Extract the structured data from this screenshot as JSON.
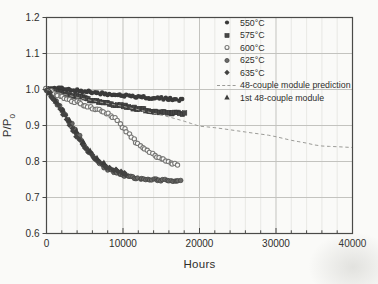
{
  "figure_label": "module-power-degradation-plot",
  "chart_data": {
    "type": "scatter",
    "title": "",
    "xlabel": "Hours",
    "ylabel": "P/P0",
    "ylabel_main": "P/P",
    "ylabel_sub": "0",
    "xlim": [
      0,
      40000
    ],
    "ylim": [
      0.6,
      1.2
    ],
    "x_major_ticks": [
      0,
      10000,
      20000,
      30000,
      40000
    ],
    "x_major_tick_labels": [
      "0",
      "10000",
      "20000",
      "30000",
      "40000"
    ],
    "x_minor_step": 2000,
    "y_major_ticks": [
      0.6,
      0.7,
      0.8,
      0.9,
      1.0,
      1.1,
      1.2
    ],
    "y_major_tick_labels": [
      "0.6",
      "0.7",
      "0.8",
      "0.9",
      "1.0",
      "1.1",
      "1.2"
    ],
    "grid": {
      "on": true,
      "major_color": "#c3c3bf",
      "minor_color": "#e4e4e0"
    },
    "axis_color": "#4a4a48",
    "text_color": "#2e2e2c",
    "legend_position": "top-right-inside",
    "series": [
      {
        "name": "550°C",
        "marker": "circle-filled",
        "color": "#3a3a3a",
        "style": "scatter-dense",
        "step": 250,
        "points": [
          [
            0,
            1.0
          ],
          [
            1000,
            1.001
          ],
          [
            2000,
            1.005
          ],
          [
            3000,
            1.0
          ],
          [
            4000,
            0.997
          ],
          [
            5000,
            0.995
          ],
          [
            6000,
            0.992
          ],
          [
            7000,
            0.99
          ],
          [
            8000,
            0.988
          ],
          [
            9000,
            0.985
          ],
          [
            10000,
            0.983
          ],
          [
            11000,
            0.982
          ],
          [
            12000,
            0.98
          ],
          [
            13000,
            0.978
          ],
          [
            14000,
            0.977
          ],
          [
            15000,
            0.975
          ],
          [
            16000,
            0.974
          ],
          [
            17000,
            0.972
          ],
          [
            17800,
            0.971
          ]
        ]
      },
      {
        "name": "575°C",
        "marker": "square-filled",
        "color": "#474746",
        "style": "scatter-dense",
        "step": 250,
        "points": [
          [
            0,
            1.0
          ],
          [
            1000,
            0.995
          ],
          [
            2000,
            0.99
          ],
          [
            3000,
            0.985
          ],
          [
            4000,
            0.98
          ],
          [
            5000,
            0.975
          ],
          [
            6000,
            0.97
          ],
          [
            7000,
            0.965
          ],
          [
            8000,
            0.962
          ],
          [
            9000,
            0.958
          ],
          [
            10000,
            0.955
          ],
          [
            11000,
            0.95
          ],
          [
            12000,
            0.947
          ],
          [
            13000,
            0.943
          ],
          [
            14000,
            0.94
          ],
          [
            15000,
            0.938
          ],
          [
            16000,
            0.936
          ],
          [
            17000,
            0.934
          ],
          [
            18200,
            0.932
          ]
        ]
      },
      {
        "name": "600°C",
        "marker": "circle-open",
        "color": "#787876",
        "style": "scatter-dense",
        "step": 300,
        "points": [
          [
            0,
            1.0
          ],
          [
            500,
            0.995
          ],
          [
            1500,
            0.985
          ],
          [
            2500,
            0.975
          ],
          [
            3500,
            0.968
          ],
          [
            4500,
            0.96
          ],
          [
            5500,
            0.952
          ],
          [
            6500,
            0.945
          ],
          [
            7500,
            0.938
          ],
          [
            8500,
            0.928
          ],
          [
            9000,
            0.92
          ],
          [
            9500,
            0.908
          ],
          [
            10000,
            0.895
          ],
          [
            10500,
            0.882
          ],
          [
            11000,
            0.87
          ],
          [
            11500,
            0.858
          ],
          [
            12000,
            0.848
          ],
          [
            12500,
            0.84
          ],
          [
            13000,
            0.833
          ],
          [
            13500,
            0.826
          ],
          [
            14000,
            0.82
          ],
          [
            14500,
            0.814
          ],
          [
            15000,
            0.809
          ],
          [
            15500,
            0.804
          ],
          [
            16000,
            0.8
          ],
          [
            16500,
            0.795
          ],
          [
            17000,
            0.79
          ],
          [
            17300,
            0.788
          ]
        ]
      },
      {
        "name": "625°C",
        "marker": "circle-gray",
        "color": "#6a6a68",
        "style": "scatter-dense",
        "step": 250,
        "points": [
          [
            0,
            1.0
          ],
          [
            500,
            0.99
          ],
          [
            1000,
            0.975
          ],
          [
            1500,
            0.96
          ],
          [
            2000,
            0.945
          ],
          [
            2500,
            0.928
          ],
          [
            3000,
            0.912
          ],
          [
            3500,
            0.895
          ],
          [
            4000,
            0.878
          ],
          [
            4500,
            0.86
          ],
          [
            5000,
            0.843
          ],
          [
            5500,
            0.828
          ],
          [
            6000,
            0.815
          ],
          [
            6500,
            0.803
          ],
          [
            7000,
            0.793
          ],
          [
            7500,
            0.785
          ],
          [
            8000,
            0.779
          ],
          [
            8500,
            0.774
          ],
          [
            9000,
            0.77
          ],
          [
            9500,
            0.766
          ],
          [
            10000,
            0.762
          ],
          [
            11000,
            0.757
          ],
          [
            12000,
            0.753
          ],
          [
            13000,
            0.751
          ],
          [
            14000,
            0.75
          ],
          [
            15000,
            0.749
          ],
          [
            16000,
            0.748
          ],
          [
            17000,
            0.747
          ],
          [
            17500,
            0.745
          ]
        ]
      },
      {
        "name": "635°C",
        "marker": "diamond-filled",
        "color": "#434342",
        "style": "scatter-dense",
        "step": 220,
        "points": [
          [
            0,
            1.0
          ],
          [
            400,
            0.99
          ],
          [
            800,
            0.978
          ],
          [
            1200,
            0.965
          ],
          [
            1600,
            0.952
          ],
          [
            2000,
            0.94
          ],
          [
            2400,
            0.926
          ],
          [
            2800,
            0.912
          ],
          [
            3200,
            0.898
          ],
          [
            3600,
            0.884
          ],
          [
            4000,
            0.87
          ],
          [
            4400,
            0.857
          ],
          [
            4800,
            0.845
          ],
          [
            5200,
            0.834
          ],
          [
            5600,
            0.824
          ],
          [
            6000,
            0.815
          ],
          [
            6400,
            0.807
          ],
          [
            6800,
            0.8
          ],
          [
            7200,
            0.794
          ],
          [
            7600,
            0.789
          ],
          [
            8000,
            0.784
          ],
          [
            8500,
            0.779
          ],
          [
            9000,
            0.775
          ],
          [
            9500,
            0.771
          ],
          [
            10000,
            0.767
          ],
          [
            10500,
            0.763
          ]
        ]
      },
      {
        "name": "48-couple module prediction",
        "marker": "dashed-line",
        "color": "#9b9b97",
        "style": "dashed",
        "points": [
          [
            0,
            1.0
          ],
          [
            2000,
            0.988
          ],
          [
            4000,
            0.978
          ],
          [
            6000,
            0.969
          ],
          [
            8000,
            0.961
          ],
          [
            10000,
            0.953
          ],
          [
            12000,
            0.944
          ],
          [
            14000,
            0.934
          ],
          [
            16000,
            0.924
          ],
          [
            18000,
            0.912
          ],
          [
            19000,
            0.905
          ],
          [
            20000,
            0.898
          ],
          [
            21000,
            0.896
          ],
          [
            22000,
            0.894
          ],
          [
            23000,
            0.891
          ],
          [
            24000,
            0.888
          ],
          [
            25000,
            0.885
          ],
          [
            26000,
            0.882
          ],
          [
            27000,
            0.879
          ],
          [
            28000,
            0.876
          ],
          [
            29000,
            0.873
          ],
          [
            30000,
            0.869
          ],
          [
            31000,
            0.864
          ],
          [
            32000,
            0.859
          ],
          [
            33000,
            0.855
          ],
          [
            34000,
            0.851
          ],
          [
            35000,
            0.846
          ],
          [
            36000,
            0.843
          ],
          [
            37000,
            0.842
          ],
          [
            38000,
            0.841
          ],
          [
            39000,
            0.84
          ],
          [
            40000,
            0.839
          ]
        ]
      },
      {
        "name": "1st 48-couple module",
        "marker": "triangle-filled",
        "color": "#3c3c3b",
        "style": "scatter-sparse",
        "points": [
          [
            300,
            0.99
          ],
          [
            1200,
            0.968
          ],
          [
            2100,
            0.943
          ],
          [
            3000,
            0.915
          ],
          [
            3900,
            0.885
          ],
          [
            4800,
            0.855
          ],
          [
            5700,
            0.83
          ],
          [
            6600,
            0.81
          ],
          [
            7500,
            0.797
          ]
        ]
      }
    ]
  }
}
